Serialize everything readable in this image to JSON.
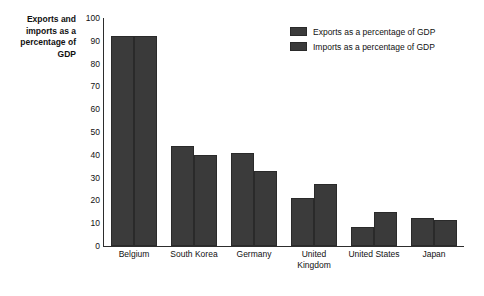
{
  "chart_data": {
    "type": "bar",
    "title": "",
    "xlabel": "",
    "ylabel": "Exports and imports as a percentage of GDP",
    "ylim": [
      0,
      100
    ],
    "yticks": [
      100,
      90,
      80,
      70,
      60,
      50,
      40,
      30,
      20,
      10,
      0
    ],
    "grid": false,
    "legend_position": "top-right",
    "categories": [
      "Belgium",
      "South Korea",
      "Germany",
      "United Kingdom",
      "United States",
      "Japan"
    ],
    "series": [
      {
        "name": "Exports as a percentage of GDP",
        "values": [
          92,
          44,
          41,
          21,
          8.5,
          12.5
        ]
      },
      {
        "name": "Imports as a percentage of GDP",
        "values": [
          92,
          40,
          33,
          27,
          15,
          11.5
        ]
      }
    ]
  },
  "axis": {
    "y_title": "Exports and imports as a percentage of GDP"
  },
  "legend": {
    "items": [
      {
        "label": "Exports as a percentage of GDP",
        "color": "#3b3b3b"
      },
      {
        "label": "Imports as a percentage of GDP",
        "color": "#3a3a3a"
      }
    ]
  },
  "colors": {
    "exports_bar": "#3b3b3b",
    "imports_bar": "#3a3a3a",
    "axis": "#2d2d2d",
    "text": "#111111",
    "background": "#ffffff"
  }
}
